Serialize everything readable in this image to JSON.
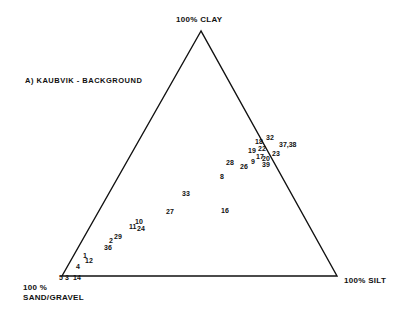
{
  "diagram": {
    "title": "A) KAUBVIK - BACKGROUND",
    "type": "ternary",
    "apex_labels": {
      "top": "100% CLAY",
      "bottom_left_line1": "100 %",
      "bottom_left_line2": "SAND/GRAVEL",
      "bottom_right": "100% SILT"
    },
    "colors": {
      "line": "#111111",
      "text": "#111111",
      "background": "#ffffff"
    },
    "points": [
      {
        "label": "32",
        "x": 266,
        "y": 137
      },
      {
        "label": "18",
        "x": 255,
        "y": 141
      },
      {
        "label": "37,38",
        "x": 279,
        "y": 144
      },
      {
        "label": "19",
        "x": 248,
        "y": 150
      },
      {
        "label": "22",
        "x": 258,
        "y": 148
      },
      {
        "label": "23",
        "x": 272,
        "y": 153
      },
      {
        "label": "17",
        "x": 256,
        "y": 156
      },
      {
        "label": "20",
        "x": 262,
        "y": 158
      },
      {
        "label": "39",
        "x": 262,
        "y": 164
      },
      {
        "label": "9",
        "x": 251,
        "y": 161
      },
      {
        "label": "26",
        "x": 240,
        "y": 166
      },
      {
        "label": "28",
        "x": 226,
        "y": 162
      },
      {
        "label": "8",
        "x": 220,
        "y": 176
      },
      {
        "label": "33",
        "x": 182,
        "y": 193
      },
      {
        "label": "27",
        "x": 166,
        "y": 211
      },
      {
        "label": "16",
        "x": 221,
        "y": 210
      },
      {
        "label": "10",
        "x": 135,
        "y": 221
      },
      {
        "label": "11",
        "x": 129,
        "y": 226
      },
      {
        "label": "24",
        "x": 137,
        "y": 228
      },
      {
        "label": "29",
        "x": 114,
        "y": 236
      },
      {
        "label": "2",
        "x": 109,
        "y": 240
      },
      {
        "label": "36",
        "x": 104,
        "y": 247
      },
      {
        "label": "1",
        "x": 83,
        "y": 255
      },
      {
        "label": "12",
        "x": 85,
        "y": 260
      },
      {
        "label": "4",
        "x": 76,
        "y": 266
      },
      {
        "label": "5",
        "x": 59,
        "y": 277
      },
      {
        "label": "3",
        "x": 65,
        "y": 277
      },
      {
        "label": "14",
        "x": 73,
        "y": 277
      }
    ]
  }
}
